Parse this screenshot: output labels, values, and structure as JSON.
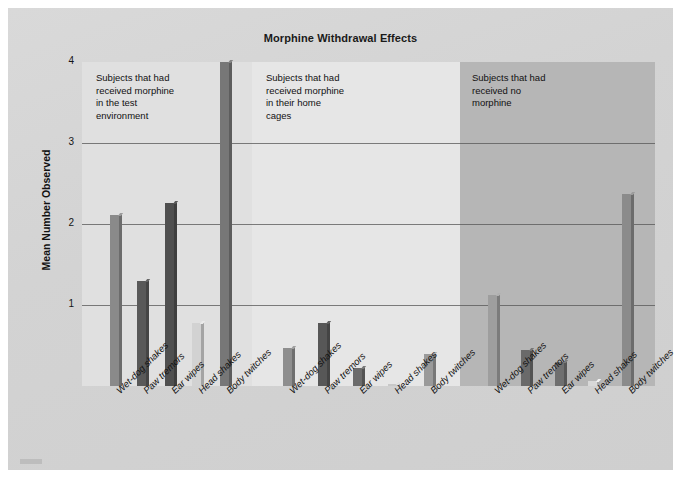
{
  "figure": {
    "title": "Morphine Withdrawal Effects",
    "ylabel": "Mean Number Observed"
  },
  "axis": {
    "yticks": [
      "1",
      "2",
      "3",
      "4"
    ]
  },
  "panels": [
    {
      "note": "Subjects that had\nreceived morphine\nin the test\nenvironment"
    },
    {
      "note": "Subjects that had\nreceived morphine\nin their home\ncages"
    },
    {
      "note": "Subjects that had\nreceived no\nmorphine"
    }
  ],
  "xlabels": [
    "Wet-dog shakes",
    "Paw tremors",
    "Ear wipes",
    "Head shakes",
    "Body twitches",
    "Wet-dog shakes",
    "Paw tremors",
    "Ear wipes",
    "Head shakes",
    "Body twitches",
    "Wet-dog shakes",
    "Paw tremors",
    "Ear wipes",
    "Head shakes",
    "Body twitches"
  ],
  "colors": {
    "page_background": "#d5d5d5",
    "panel_1_background": "#e0e0e0",
    "panel_2_background": "#e6e6e6",
    "panel_3_background": "#b6b6b6",
    "gridline": "#555555",
    "text": "#111111"
  },
  "chart_data": {
    "type": "bar",
    "title": "Morphine Withdrawal Effects",
    "xlabel": "",
    "ylabel": "Mean Number Observed",
    "ylim": [
      0,
      4
    ],
    "yticks": [
      1,
      2,
      3,
      4
    ],
    "grid": true,
    "legend": "none",
    "categories": [
      "Wet-dog shakes",
      "Paw tremors",
      "Ear wipes",
      "Head shakes",
      "Body twitches"
    ],
    "groups": [
      {
        "name": "Subjects that had received morphine in the test environment",
        "values": [
          2.11,
          1.3,
          2.26,
          0.78,
          4.0
        ],
        "bar_colors": [
          "#8a8a8a",
          "#595959",
          "#4f4f4f",
          "#d2d2d2",
          "#777777"
        ]
      },
      {
        "name": "Subjects that had received morphine in their home cages",
        "values": [
          0.47,
          0.78,
          0.22,
          0.02,
          0.4
        ],
        "bar_colors": [
          "#8e8e8e",
          "#575757",
          "#6b6b6b",
          "#c8c8c8",
          "#9a9a9a"
        ]
      },
      {
        "name": "Subjects that had received no morphine",
        "values": [
          1.12,
          0.45,
          0.3,
          0.06,
          2.37
        ],
        "bar_colors": [
          "#9e9e9e",
          "#6a6a6a",
          "#6f6f6f",
          "#d8d8d8",
          "#8b8b8b"
        ]
      }
    ]
  }
}
